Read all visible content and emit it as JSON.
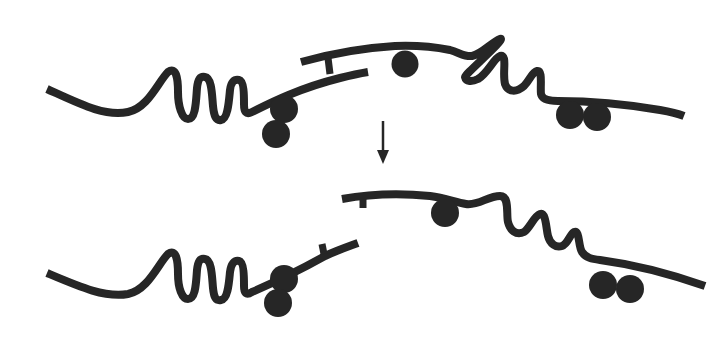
{
  "diagram": {
    "title": "",
    "description": "Two-state schematic: two wavy strands with attached beads, joined at top, separated after transition (down arrow).",
    "colors": {
      "stroke": "#262626",
      "background": "#ffffff"
    },
    "panels": [
      {
        "name": "before",
        "left_strand": {
          "zigzag_loops": 3,
          "beads": 2,
          "bead_arrangement": "stacked-vertical"
        },
        "right_strand": {
          "zigzag_loops": 3,
          "beads": 3,
          "bead_arrangement": "single-top, pair-bottom"
        },
        "junction": "I-shaped bridge connecting strands"
      },
      {
        "name": "after",
        "left_strand": {
          "zigzag_loops": 3,
          "beads": 2,
          "bead_arrangement": "stacked-vertical"
        },
        "right_strand": {
          "zigzag_loops": 3,
          "beads": 3,
          "bead_arrangement": "single-top, pair-bottom"
        },
        "junction": "bridge cleaved, small stubs on each end"
      }
    ],
    "arrow": {
      "direction": "down",
      "icon": "arrow-down-icon"
    }
  }
}
